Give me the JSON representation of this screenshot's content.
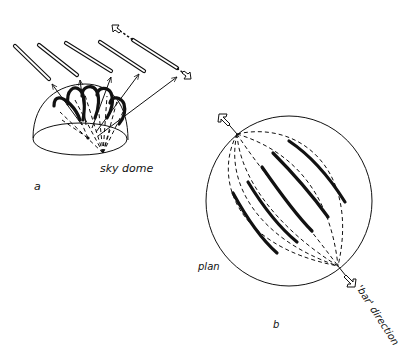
{
  "figure": {
    "panel_a": {
      "label": "a",
      "caption": "sky dome",
      "tube_count": 5,
      "arc_count": 5
    },
    "panel_b": {
      "label": "b",
      "plan_label": "plan",
      "direction_label": "'bar' direction",
      "bar_count": 5
    }
  }
}
